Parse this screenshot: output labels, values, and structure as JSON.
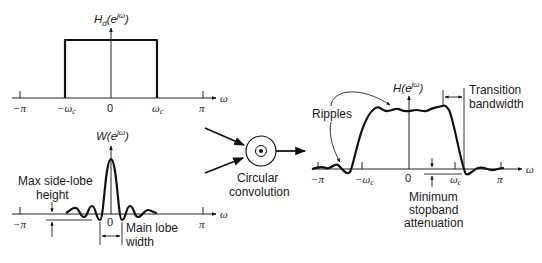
{
  "colors": {
    "ink": "#1a1a1a",
    "background": "#ffffff"
  },
  "panel_ideal": {
    "title": "H_d(e^{jω})",
    "title_main": "H",
    "title_sub": "d",
    "title_paren": "(e",
    "title_sup": "jω",
    "title_close": ")",
    "axis_label": "ω",
    "ticks": [
      "−π",
      "−ω",
      "0",
      "ω",
      "π"
    ],
    "tick_sub": "c"
  },
  "panel_window": {
    "title_main": "W(e",
    "title_sup": "jω",
    "title_close": ")",
    "axis_label": "ω",
    "ticks": [
      "−π",
      "0",
      "π"
    ],
    "annotation_sidelobe": [
      "Max side-lobe",
      "height"
    ],
    "annotation_mainlobe": [
      "Main lobe",
      "width"
    ]
  },
  "convolution": {
    "symbol": "⊛",
    "label": [
      "Circular",
      "convolution"
    ]
  },
  "panel_result": {
    "title_main": "H(e",
    "title_sup": "jω",
    "title_close": ")",
    "axis_label": "ω",
    "ticks": [
      "−π",
      "−ω",
      "0",
      "ω",
      "π"
    ],
    "tick_sub": "c",
    "annotation_ripples": "Ripples",
    "annotation_transition": [
      "Transition",
      "bandwidth"
    ],
    "annotation_stopband": [
      "Minimum",
      "stopband",
      "attenuation"
    ]
  }
}
